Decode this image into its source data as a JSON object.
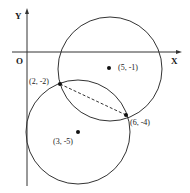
{
  "diagram": {
    "axes": {
      "x_label": "X",
      "y_label": "Y",
      "origin_label": "O"
    },
    "circles": [
      {
        "name": "upper-circle",
        "center_label": "(5, -1)",
        "center": [
          5,
          -1
        ]
      },
      {
        "name": "lower-circle",
        "center_label": "(3, -5)",
        "center": [
          3,
          -5
        ]
      }
    ],
    "intersection_points": [
      {
        "label": "(2, -2)",
        "coords": [
          2,
          -2
        ]
      },
      {
        "label": "(6, -4)",
        "coords": [
          6,
          -4
        ]
      }
    ],
    "chord": {
      "style": "dashed",
      "from": "(2, -2)",
      "to": "(6, -4)"
    },
    "colors": {
      "stroke": "#333333",
      "point": "#111111"
    }
  }
}
